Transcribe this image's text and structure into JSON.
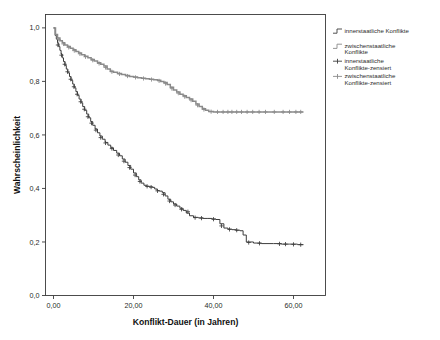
{
  "chart_data": {
    "type": "line",
    "subtype": "kaplan-meier-survival",
    "title": "",
    "xlabel": "Konflikt-Dauer (in Jahren)",
    "ylabel": "Wahrscheinlichkeit",
    "xlim": [
      -2,
      68
    ],
    "ylim": [
      0.0,
      1.05
    ],
    "grid": false,
    "legend_position": "right",
    "xticks": [
      0,
      20,
      40,
      60
    ],
    "xticklabels": [
      "0,00",
      "20,00",
      "40,00",
      "60,00"
    ],
    "yticks": [
      0.0,
      0.2,
      0.4,
      0.6,
      0.8,
      1.0
    ],
    "yticklabels": [
      "0,0",
      "0,2",
      "0,4",
      "0,6",
      "0,8",
      "1,0"
    ],
    "series": [
      {
        "name": "innerstaatliche Konflikte",
        "color": "#3d3d3d",
        "style": "step",
        "points": [
          [
            0.0,
            1.0
          ],
          [
            0.4,
            0.972
          ],
          [
            0.7,
            0.958
          ],
          [
            1.0,
            0.944
          ],
          [
            1.3,
            0.93
          ],
          [
            1.6,
            0.916
          ],
          [
            1.9,
            0.902
          ],
          [
            2.2,
            0.888
          ],
          [
            2.5,
            0.874
          ],
          [
            2.9,
            0.86
          ],
          [
            3.2,
            0.846
          ],
          [
            3.6,
            0.832
          ],
          [
            4.0,
            0.818
          ],
          [
            4.4,
            0.804
          ],
          [
            4.8,
            0.79
          ],
          [
            5.2,
            0.776
          ],
          [
            5.6,
            0.762
          ],
          [
            6.0,
            0.748
          ],
          [
            6.4,
            0.734
          ],
          [
            6.9,
            0.72
          ],
          [
            7.3,
            0.706
          ],
          [
            7.8,
            0.692
          ],
          [
            8.3,
            0.678
          ],
          [
            8.8,
            0.664
          ],
          [
            9.3,
            0.65
          ],
          [
            9.8,
            0.636
          ],
          [
            10.4,
            0.622
          ],
          [
            11.0,
            0.608
          ],
          [
            11.6,
            0.596
          ],
          [
            12.2,
            0.584
          ],
          [
            12.9,
            0.572
          ],
          [
            13.6,
            0.562
          ],
          [
            14.3,
            0.552
          ],
          [
            15.0,
            0.542
          ],
          [
            15.8,
            0.532
          ],
          [
            16.5,
            0.522
          ],
          [
            17.2,
            0.51
          ],
          [
            17.9,
            0.498
          ],
          [
            18.6,
            0.486
          ],
          [
            19.3,
            0.472
          ],
          [
            20.0,
            0.458
          ],
          [
            20.7,
            0.444
          ],
          [
            21.3,
            0.432
          ],
          [
            21.9,
            0.42
          ],
          [
            22.6,
            0.412
          ],
          [
            23.2,
            0.408
          ],
          [
            24.0,
            0.406
          ],
          [
            24.8,
            0.404
          ],
          [
            25.3,
            0.398
          ],
          [
            25.9,
            0.392
          ],
          [
            26.5,
            0.39
          ],
          [
            27.2,
            0.384
          ],
          [
            27.9,
            0.372
          ],
          [
            28.6,
            0.36
          ],
          [
            29.3,
            0.35
          ],
          [
            30.0,
            0.342
          ],
          [
            30.8,
            0.334
          ],
          [
            31.6,
            0.326
          ],
          [
            32.4,
            0.318
          ],
          [
            33.2,
            0.308
          ],
          [
            34.0,
            0.298
          ],
          [
            35.0,
            0.292
          ],
          [
            36.2,
            0.29
          ],
          [
            37.4,
            0.288
          ],
          [
            38.6,
            0.288
          ],
          [
            39.6,
            0.286
          ],
          [
            40.6,
            0.284
          ],
          [
            41.6,
            0.268
          ],
          [
            42.6,
            0.252
          ],
          [
            43.6,
            0.248
          ],
          [
            44.6,
            0.246
          ],
          [
            45.6,
            0.244
          ],
          [
            46.6,
            0.242
          ],
          [
            47.4,
            0.226
          ],
          [
            48.2,
            0.2
          ],
          [
            50.0,
            0.196
          ],
          [
            52.0,
            0.194
          ],
          [
            55.0,
            0.194
          ],
          [
            57.0,
            0.192
          ],
          [
            59.0,
            0.192
          ],
          [
            61.0,
            0.19
          ],
          [
            62.5,
            0.19
          ]
        ],
        "censored": [
          [
            1.1,
            0.936
          ],
          [
            2.0,
            0.898
          ],
          [
            2.8,
            0.864
          ],
          [
            3.5,
            0.836
          ],
          [
            4.3,
            0.808
          ],
          [
            5.1,
            0.78
          ],
          [
            5.9,
            0.752
          ],
          [
            6.8,
            0.724
          ],
          [
            7.7,
            0.696
          ],
          [
            8.6,
            0.668
          ],
          [
            9.5,
            0.644
          ],
          [
            10.6,
            0.618
          ],
          [
            11.8,
            0.59
          ],
          [
            13.0,
            0.57
          ],
          [
            14.6,
            0.549
          ],
          [
            16.2,
            0.525
          ],
          [
            17.6,
            0.502
          ],
          [
            19.0,
            0.478
          ],
          [
            20.4,
            0.45
          ],
          [
            21.6,
            0.426
          ],
          [
            23.4,
            0.408
          ],
          [
            24.4,
            0.405
          ],
          [
            26.0,
            0.391
          ],
          [
            27.5,
            0.378
          ],
          [
            29.0,
            0.353
          ],
          [
            30.4,
            0.338
          ],
          [
            32.0,
            0.322
          ],
          [
            33.6,
            0.313
          ],
          [
            35.4,
            0.291
          ],
          [
            37.0,
            0.289
          ],
          [
            40.0,
            0.285
          ],
          [
            42.0,
            0.26
          ],
          [
            44.0,
            0.247
          ],
          [
            45.8,
            0.244
          ],
          [
            48.8,
            0.198
          ],
          [
            51.5,
            0.195
          ],
          [
            56.5,
            0.193
          ],
          [
            58.0,
            0.192
          ],
          [
            60.0,
            0.191
          ],
          [
            61.8,
            0.19
          ]
        ]
      },
      {
        "name": "zwischenstaatliche Konflikte",
        "color": "#8a8a8a",
        "style": "step",
        "points": [
          [
            0.0,
            1.0
          ],
          [
            0.5,
            0.975
          ],
          [
            1.0,
            0.962
          ],
          [
            1.6,
            0.952
          ],
          [
            2.2,
            0.944
          ],
          [
            2.8,
            0.936
          ],
          [
            3.5,
            0.93
          ],
          [
            4.2,
            0.924
          ],
          [
            4.9,
            0.918
          ],
          [
            5.6,
            0.912
          ],
          [
            6.3,
            0.906
          ],
          [
            7.0,
            0.9
          ],
          [
            7.8,
            0.894
          ],
          [
            8.6,
            0.888
          ],
          [
            9.4,
            0.882
          ],
          [
            10.2,
            0.876
          ],
          [
            11.0,
            0.87
          ],
          [
            11.8,
            0.864
          ],
          [
            12.6,
            0.858
          ],
          [
            13.4,
            0.846
          ],
          [
            14.2,
            0.838
          ],
          [
            15.0,
            0.834
          ],
          [
            16.0,
            0.83
          ],
          [
            17.0,
            0.826
          ],
          [
            18.0,
            0.822
          ],
          [
            19.0,
            0.818
          ],
          [
            20.0,
            0.816
          ],
          [
            21.0,
            0.814
          ],
          [
            22.0,
            0.812
          ],
          [
            23.0,
            0.81
          ],
          [
            24.0,
            0.808
          ],
          [
            25.0,
            0.806
          ],
          [
            26.0,
            0.804
          ],
          [
            26.8,
            0.8
          ],
          [
            27.6,
            0.796
          ],
          [
            28.4,
            0.788
          ],
          [
            29.2,
            0.778
          ],
          [
            30.0,
            0.768
          ],
          [
            30.8,
            0.76
          ],
          [
            31.6,
            0.752
          ],
          [
            32.4,
            0.746
          ],
          [
            33.2,
            0.74
          ],
          [
            34.0,
            0.734
          ],
          [
            34.8,
            0.726
          ],
          [
            35.6,
            0.716
          ],
          [
            36.4,
            0.706
          ],
          [
            37.2,
            0.698
          ],
          [
            38.0,
            0.692
          ],
          [
            38.8,
            0.688
          ],
          [
            40.0,
            0.686
          ],
          [
            42.0,
            0.686
          ],
          [
            45.0,
            0.686
          ],
          [
            48.0,
            0.686
          ],
          [
            51.0,
            0.686
          ],
          [
            54.0,
            0.686
          ],
          [
            57.0,
            0.686
          ],
          [
            60.0,
            0.686
          ],
          [
            62.5,
            0.686
          ]
        ],
        "censored": [
          [
            1.3,
            0.957
          ],
          [
            2.5,
            0.94
          ],
          [
            3.8,
            0.927
          ],
          [
            5.2,
            0.915
          ],
          [
            6.6,
            0.903
          ],
          [
            8.0,
            0.892
          ],
          [
            9.8,
            0.879
          ],
          [
            11.4,
            0.867
          ],
          [
            13.0,
            0.852
          ],
          [
            14.6,
            0.836
          ],
          [
            16.5,
            0.828
          ],
          [
            18.5,
            0.82
          ],
          [
            20.5,
            0.815
          ],
          [
            22.5,
            0.811
          ],
          [
            24.5,
            0.807
          ],
          [
            26.4,
            0.802
          ],
          [
            28.0,
            0.792
          ],
          [
            29.6,
            0.773
          ],
          [
            31.2,
            0.756
          ],
          [
            32.8,
            0.743
          ],
          [
            34.4,
            0.73
          ],
          [
            36.0,
            0.711
          ],
          [
            37.6,
            0.695
          ],
          [
            39.4,
            0.687
          ],
          [
            41.0,
            0.686
          ],
          [
            42.4,
            0.686
          ],
          [
            43.6,
            0.686
          ],
          [
            44.6,
            0.686
          ],
          [
            45.8,
            0.686
          ],
          [
            47.0,
            0.686
          ],
          [
            48.4,
            0.686
          ],
          [
            49.8,
            0.686
          ],
          [
            51.4,
            0.686
          ],
          [
            53.0,
            0.686
          ],
          [
            55.2,
            0.686
          ],
          [
            57.4,
            0.686
          ],
          [
            59.0,
            0.686
          ],
          [
            60.6,
            0.686
          ],
          [
            61.8,
            0.686
          ]
        ]
      }
    ],
    "legend": [
      {
        "label": "innerstaatliche Konflikte",
        "marker": "step-line",
        "color": "#3d3d3d"
      },
      {
        "label": "zwischenstaatliche Konflikte",
        "marker": "step-line",
        "color": "#8a8a8a"
      },
      {
        "label": "innerstaatliche Konflikte-zensiert",
        "marker": "plus",
        "color": "#3d3d3d"
      },
      {
        "label": "zwischenstaatliche Konflikte-zensiert",
        "marker": "plus",
        "color": "#8a8a8a"
      }
    ]
  }
}
